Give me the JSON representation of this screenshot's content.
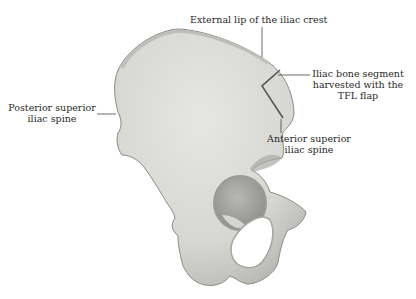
{
  "figure": {
    "labels": {
      "external_lip": "External lip of the iliac crest",
      "psis_line1": "Posterior superior",
      "psis_line2": "iliac spine",
      "segment_line1": "Iliac bone segment",
      "segment_line2": "harvested with the",
      "segment_line3": "TFL flap",
      "asis_line1": "Anterior superior",
      "asis_line2": "iliac spine"
    },
    "colors": {
      "bone": "#d9d9d6",
      "bone_shadow": "#a9a9a5",
      "outline": "#8a8a86",
      "segment_outline": "#555555",
      "leader": "#444444",
      "text": "#2a2a2a"
    }
  }
}
